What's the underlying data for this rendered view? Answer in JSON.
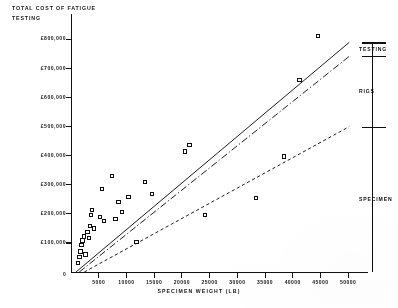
{
  "chart_data": {
    "type": "scatter",
    "title": "TOTAL COST OF FATIGUE TESTING",
    "xlabel": "SPECIMEN WEIGHT (LB)",
    "ylabel": "TOTAL COST OF FATIGUE TESTING",
    "xlim": [
      0,
      52500
    ],
    "ylim": [
      0,
      860000
    ],
    "grid": false,
    "legend_position": "right-brackets",
    "origin_label": "0",
    "y_tick_values": [
      100000,
      200000,
      300000,
      400000,
      500000,
      600000,
      700000,
      800000
    ],
    "y_tick_labels": [
      "£100,000",
      "£200,000",
      "£300,000",
      "£400,000",
      "£500,000",
      "£600,000",
      "£700,000",
      "£800,000"
    ],
    "x_tick_values": [
      5000,
      10000,
      15000,
      20000,
      25000,
      30000,
      35000,
      40000,
      45000,
      50000
    ],
    "x_tick_labels": [
      "5000",
      "10000",
      "15000",
      "20000",
      "25000",
      "30000",
      "35000",
      "40000",
      "45000",
      "50000"
    ],
    "points": [
      {
        "x": 1300,
        "y": 30000
      },
      {
        "x": 1500,
        "y": 52000
      },
      {
        "x": 1700,
        "y": 70000
      },
      {
        "x": 1900,
        "y": 92000
      },
      {
        "x": 2100,
        "y": 108000
      },
      {
        "x": 2300,
        "y": 122000
      },
      {
        "x": 2600,
        "y": 60000
      },
      {
        "x": 3000,
        "y": 138000
      },
      {
        "x": 3200,
        "y": 118000
      },
      {
        "x": 3400,
        "y": 158000
      },
      {
        "x": 3600,
        "y": 196000
      },
      {
        "x": 3800,
        "y": 214000
      },
      {
        "x": 4200,
        "y": 150000
      },
      {
        "x": 5200,
        "y": 190000
      },
      {
        "x": 5600,
        "y": 286000
      },
      {
        "x": 6000,
        "y": 176000
      },
      {
        "x": 7400,
        "y": 330000
      },
      {
        "x": 8000,
        "y": 182000
      },
      {
        "x": 8600,
        "y": 240000
      },
      {
        "x": 9200,
        "y": 206000
      },
      {
        "x": 10400,
        "y": 258000
      },
      {
        "x": 11800,
        "y": 104000
      },
      {
        "x": 13400,
        "y": 310000
      },
      {
        "x": 14600,
        "y": 268000
      },
      {
        "x": 20600,
        "y": 414000
      },
      {
        "x": 21400,
        "y": 436000
      },
      {
        "x": 24200,
        "y": 196000
      },
      {
        "x": 33400,
        "y": 254000
      },
      {
        "x": 38400,
        "y": 398000
      },
      {
        "x": 41200,
        "y": 660000
      },
      {
        "x": 44600,
        "y": 812000
      }
    ],
    "trend_lines": [
      {
        "name": "upper-bound",
        "style": "solid",
        "x0": 900,
        "y0": 0,
        "x1": 50200,
        "y1": 790000
      },
      {
        "name": "mid-estimate",
        "style": "dash-dot",
        "x0": 1500,
        "y0": 0,
        "x1": 50200,
        "y1": 742000
      },
      {
        "name": "lower-bound",
        "style": "dashed",
        "x0": 2400,
        "y0": 0,
        "x1": 50200,
        "y1": 500000
      }
    ],
    "brackets": [
      {
        "label": "TESTING",
        "top_value": 790000,
        "bottom_value": 742000
      },
      {
        "label": "RIGS",
        "top_value": 742000,
        "bottom_value": 500000
      },
      {
        "label": "SPECIMEN",
        "top_value": 500000,
        "bottom_value": 0
      }
    ]
  }
}
